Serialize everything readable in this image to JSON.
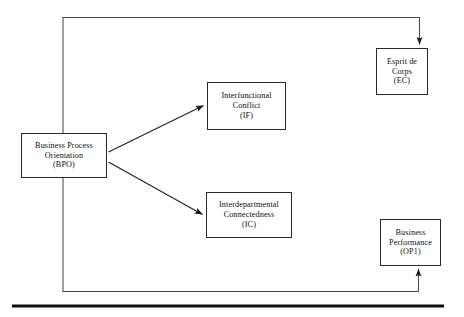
{
  "diagram": {
    "background_color": "#ffffff",
    "line_color": "#2a2a2a",
    "rule_color": "#111111",
    "nodes": [
      {
        "id": "bpo",
        "name": "business-process-orientation",
        "lines": [
          "Business Process",
          "Orientation",
          "(BPO)"
        ],
        "line1": "Business Process",
        "line2": "Orientation",
        "line3": "(BPO)"
      },
      {
        "id": "if",
        "name": "interfunctional-conflict",
        "lines": [
          "Interfunctional",
          "Conflict",
          "(IF)"
        ],
        "line1": "Interfunctional",
        "line2": "Conflict",
        "line3": "(IF)"
      },
      {
        "id": "ic",
        "name": "interdepartmental-connectedness",
        "lines": [
          "Interdepartmental",
          "Connectedness",
          "(IC)"
        ],
        "line1": "Interdepartmental",
        "line2": "Connectedness",
        "line3": "(IC)"
      },
      {
        "id": "ec",
        "name": "esprit-de-corps",
        "lines": [
          "Esprit de",
          "Corps",
          "(EC)"
        ],
        "line1": "Esprit de",
        "line2": "Corps",
        "line3": "(EC)"
      },
      {
        "id": "op1",
        "name": "business-performance",
        "lines": [
          "Business",
          "Performance",
          "(OP1)"
        ],
        "line1": "Business",
        "line2": "Performance",
        "line3": "(OP1)"
      }
    ],
    "edges": [
      {
        "id": "bpo-to-if",
        "from": "bpo",
        "to": "if",
        "style": "diagonal-arrow",
        "label": ""
      },
      {
        "id": "bpo-to-ic",
        "from": "bpo",
        "to": "ic",
        "style": "diagonal-arrow",
        "label": ""
      },
      {
        "id": "bpo-to-ec",
        "from": "bpo",
        "to": "ec",
        "style": "orthogonal-top-arrow",
        "label": ""
      },
      {
        "id": "bpo-to-op1",
        "from": "bpo",
        "to": "op1",
        "style": "orthogonal-bottom-arrow",
        "label": ""
      }
    ],
    "footer_rule": {
      "name": "bottom-rule",
      "visible": true
    }
  }
}
